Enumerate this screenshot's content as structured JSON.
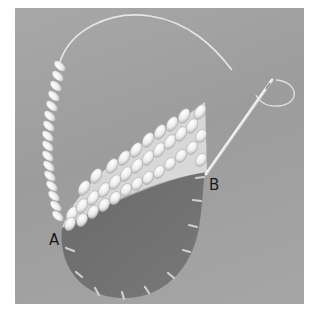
{
  "illustration": {
    "subject": "embroidery stitching diagram with needle and thread",
    "labels": {
      "a": "A",
      "b": "B"
    },
    "colors": {
      "background_panel": "#a3a3a3",
      "fabric_shape": "#6e6e6e",
      "thread": "#f2f2f2",
      "label_text": "#1a1a1a"
    }
  }
}
